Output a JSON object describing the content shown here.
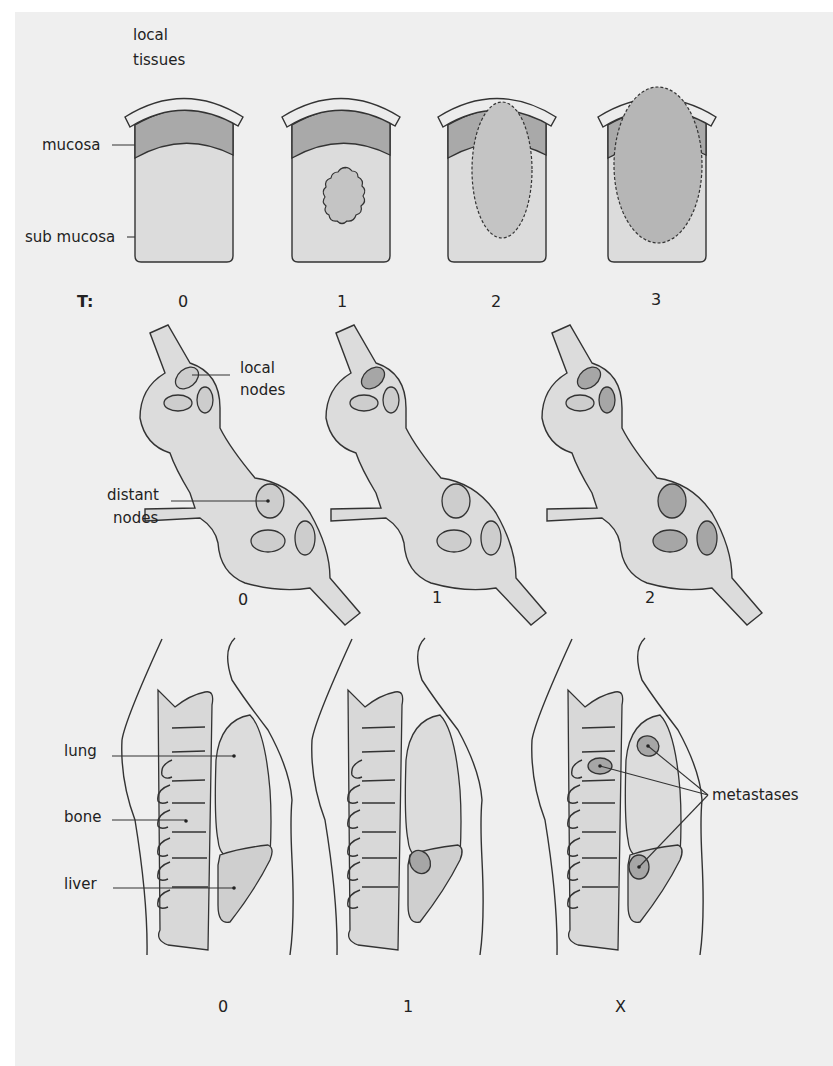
{
  "colors": {
    "background": "#efefef",
    "tissue_light": "#dcdcdc",
    "mucosa": "#a9a9a9",
    "tumour": "#c4c4c4",
    "serosa": "#ececec",
    "node_normal": "#cdcdcd",
    "node_involved": "#a6a6a6",
    "organ": "#d8d8d8",
    "outline": "#333333"
  },
  "t_section": {
    "prefix": "T:",
    "labels": {
      "local_tissues": [
        "local",
        "tissues"
      ],
      "mucosa": "mucosa",
      "sub_mucosa": "sub mucosa"
    },
    "stages": [
      "0",
      "1",
      "2",
      "3"
    ]
  },
  "n_section": {
    "labels": {
      "local_nodes": [
        "local",
        "nodes"
      ],
      "distant_nodes": [
        "distant",
        "nodes"
      ]
    },
    "stages": [
      "0",
      "1",
      "2"
    ]
  },
  "m_section": {
    "labels": {
      "lung": "lung",
      "bone": "bone",
      "liver": "liver",
      "metastases": "metastases"
    },
    "stages": [
      "0",
      "1",
      "X"
    ]
  }
}
